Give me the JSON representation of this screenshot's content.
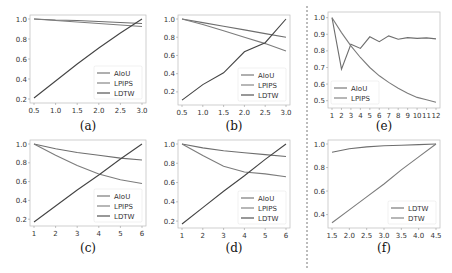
{
  "chart_data": [
    {
      "id": "a",
      "caption": "(a)",
      "type": "line",
      "x": [
        0.5,
        1.0,
        1.5,
        2.0,
        2.5,
        3.0
      ],
      "xticks": [
        "0.5",
        "1.0",
        "1.5",
        "2.0",
        "2.5",
        "3.0"
      ],
      "yticks": [
        "0.2",
        "0.4",
        "0.6",
        "0.8",
        "1.0"
      ],
      "xlim": [
        0.5,
        3.0
      ],
      "ylim": [
        0.2,
        1.0
      ],
      "series": [
        {
          "name": "AIoU",
          "values": [
            1.0,
            0.99,
            0.985,
            0.975,
            0.965,
            0.955
          ]
        },
        {
          "name": "LPIPS",
          "values": [
            1.0,
            0.985,
            0.97,
            0.955,
            0.94,
            0.925
          ]
        },
        {
          "name": "LDTW",
          "values": [
            0.21,
            0.38,
            0.55,
            0.71,
            0.86,
            1.0
          ]
        }
      ],
      "legend": {
        "position": "lower right",
        "entries": [
          "AIoU",
          "LPIPS",
          "LDTW"
        ]
      }
    },
    {
      "id": "b",
      "caption": "(b)",
      "type": "line",
      "x": [
        0.5,
        1.0,
        1.5,
        2.0,
        2.5,
        3.0
      ],
      "xticks": [
        "0.5",
        "1.0",
        "1.5",
        "2.0",
        "2.5",
        "3.0"
      ],
      "yticks": [
        "0.2",
        "0.4",
        "0.6",
        "0.8",
        "1.0"
      ],
      "xlim": [
        0.5,
        3.0
      ],
      "ylim": [
        0.1,
        1.0
      ],
      "series": [
        {
          "name": "AIoU",
          "values": [
            1.0,
            0.96,
            0.92,
            0.88,
            0.84,
            0.8
          ]
        },
        {
          "name": "LPIPS",
          "values": [
            1.0,
            0.94,
            0.87,
            0.8,
            0.73,
            0.65
          ]
        },
        {
          "name": "LDTW",
          "values": [
            0.11,
            0.28,
            0.41,
            0.64,
            0.74,
            1.0
          ]
        }
      ],
      "legend": {
        "position": "lower right",
        "entries": [
          "AIoU",
          "LPIPS",
          "LDTW"
        ]
      }
    },
    {
      "id": "e",
      "caption": "(e)",
      "type": "line",
      "x": [
        1,
        2,
        3,
        4,
        5,
        6,
        7,
        8,
        9,
        10,
        11,
        12
      ],
      "xticks": [
        "1",
        "2",
        "3",
        "4",
        "5",
        "6",
        "7",
        "8",
        "9",
        "10",
        "11",
        "12"
      ],
      "yticks": [
        "0.5",
        "0.6",
        "0.7",
        "0.8",
        "0.9",
        "1.0"
      ],
      "xlim": [
        1,
        12
      ],
      "ylim": [
        0.48,
        1.01
      ],
      "series": [
        {
          "name": "AIoU",
          "values": [
            1.0,
            0.69,
            0.84,
            0.815,
            0.885,
            0.855,
            0.89,
            0.87,
            0.88,
            0.875,
            0.878,
            0.872
          ]
        },
        {
          "name": "LPIPS",
          "values": [
            1.0,
            0.91,
            0.83,
            0.76,
            0.7,
            0.65,
            0.61,
            0.575,
            0.545,
            0.52,
            0.505,
            0.49
          ]
        }
      ],
      "legend": {
        "position": "lower left",
        "entries": [
          "AIoU",
          "LPIPS"
        ]
      }
    },
    {
      "id": "c",
      "caption": "(c)",
      "type": "line",
      "x": [
        1,
        2,
        3,
        4,
        5,
        6
      ],
      "xticks": [
        "1",
        "2",
        "3",
        "4",
        "5",
        "6"
      ],
      "yticks": [
        "0.2",
        "0.4",
        "0.6",
        "0.8",
        "1.0"
      ],
      "xlim": [
        1,
        6
      ],
      "ylim": [
        0.17,
        1.0
      ],
      "series": [
        {
          "name": "AIoU",
          "values": [
            1.0,
            0.95,
            0.91,
            0.88,
            0.85,
            0.83
          ]
        },
        {
          "name": "LPIPS",
          "values": [
            1.0,
            0.88,
            0.77,
            0.68,
            0.62,
            0.58
          ]
        },
        {
          "name": "LDTW",
          "values": [
            0.17,
            0.34,
            0.51,
            0.67,
            0.84,
            1.0
          ]
        }
      ],
      "legend": {
        "position": "lower right",
        "entries": [
          "AIoU",
          "LPIPS",
          "LDTW"
        ]
      }
    },
    {
      "id": "d",
      "caption": "(d)",
      "type": "line",
      "x": [
        1,
        2,
        3,
        4,
        5,
        6
      ],
      "xticks": [
        "1",
        "2",
        "3",
        "4",
        "5",
        "6"
      ],
      "yticks": [
        "0.2",
        "0.4",
        "0.6",
        "0.8",
        "1.0"
      ],
      "xlim": [
        1,
        6
      ],
      "ylim": [
        0.17,
        1.0
      ],
      "series": [
        {
          "name": "AIoU",
          "values": [
            1.0,
            0.96,
            0.93,
            0.91,
            0.89,
            0.87
          ]
        },
        {
          "name": "LPIPS",
          "values": [
            1.0,
            0.88,
            0.77,
            0.71,
            0.69,
            0.66
          ]
        },
        {
          "name": "LDTW",
          "values": [
            0.17,
            0.34,
            0.51,
            0.67,
            0.84,
            1.0
          ]
        }
      ],
      "legend": {
        "position": "lower right",
        "entries": [
          "AIoU",
          "LPIPS",
          "LDTW"
        ]
      }
    },
    {
      "id": "f",
      "caption": "(f)",
      "type": "line",
      "x": [
        1.5,
        2.0,
        2.5,
        3.0,
        3.5,
        4.0,
        4.5
      ],
      "xticks": [
        "1.5",
        "2.0",
        "2.5",
        "3.0",
        "3.5",
        "4.0",
        "4.5"
      ],
      "yticks": [
        "0.4",
        "0.6",
        "0.8",
        "1.0"
      ],
      "xlim": [
        1.5,
        4.5
      ],
      "ylim": [
        0.32,
        1.0
      ],
      "series": [
        {
          "name": "LDTW",
          "values": [
            0.93,
            0.96,
            0.975,
            0.985,
            0.99,
            0.995,
            1.0
          ]
        },
        {
          "name": "DTW",
          "values": [
            0.33,
            0.44,
            0.55,
            0.66,
            0.78,
            0.89,
            1.0
          ]
        }
      ],
      "legend": {
        "position": "lower right",
        "entries": [
          "LDTW",
          "DTW"
        ]
      }
    }
  ],
  "colors": {
    "line": "#555555",
    "axis": "#bbbbbb",
    "divider": "#555555"
  }
}
